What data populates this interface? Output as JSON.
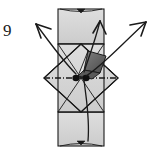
{
  "figure": {
    "kind": "origami-fold-diagram",
    "step_number": "9",
    "title": "",
    "colors": {
      "paper_fill": "#d3d3d3",
      "paper_fill_light": "#dcdcdc",
      "shaded_flap": "#6e6e6e",
      "shaded_flap_dark": "#4f4f4f",
      "outline": "#1a1a1a",
      "fold_line": "#1a1a1a",
      "background": "#ffffff"
    },
    "shapes": [
      {
        "name": "top-rectangle-flap",
        "type": "rectangle",
        "fill": "#d3d3d3"
      },
      {
        "name": "bottom-rectangle-flap",
        "type": "rectangle",
        "fill": "#d3d3d3"
      },
      {
        "name": "central-diamond",
        "type": "square-rotated-45",
        "fill": "#d3d3d3"
      },
      {
        "name": "center-shaded-flap",
        "type": "quadrilateral",
        "fill": "#6e6e6e"
      },
      {
        "name": "center-pivot-dots",
        "type": "dots",
        "count": "2"
      }
    ],
    "lines": [
      {
        "name": "horizontal-valley-fold",
        "style": "dash-dot"
      },
      {
        "name": "diagonal-crease-left",
        "style": "solid"
      },
      {
        "name": "diagonal-crease-right",
        "style": "solid"
      },
      {
        "name": "top-hidden-edge-curve",
        "style": "thin-curve"
      },
      {
        "name": "bottom-hidden-edge-curve",
        "style": "thin-curve"
      }
    ],
    "arrows": [
      {
        "name": "arrow-upper-left",
        "direction": "up-left",
        "head": "open-barbed"
      },
      {
        "name": "arrow-upper-right",
        "direction": "up-right",
        "head": "open-barbed"
      },
      {
        "name": "arrow-up-center",
        "direction": "up",
        "head": "open-barbed"
      },
      {
        "name": "arrow-down-center",
        "direction": "down",
        "head": "none"
      }
    ],
    "markers": [
      {
        "name": "top-edge-triangle-marker",
        "shape": "triangle-down"
      },
      {
        "name": "bottom-edge-triangle-marker",
        "shape": "triangle-down"
      }
    ]
  }
}
